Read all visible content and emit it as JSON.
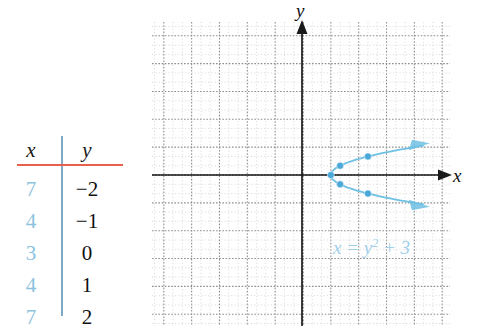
{
  "table": {
    "name": "xy-value-table",
    "headers": {
      "x": "x",
      "y": "y"
    },
    "rows": [
      {
        "x": "7",
        "y": "−2"
      },
      {
        "x": "4",
        "y": "−1"
      },
      {
        "x": "3",
        "y": "0"
      },
      {
        "x": "4",
        "y": "1"
      },
      {
        "x": "7",
        "y": "2"
      }
    ],
    "rule_color": "#e8604c",
    "divider_color": "#7fa8c6",
    "x_value_color": "#8cc3e0",
    "y_value_color": "#111111"
  },
  "graph": {
    "x_axis_label": "x",
    "y_axis_label": "y",
    "equation_lhs": "x = y",
    "equation_exp": "2",
    "equation_rhs": "+ 3",
    "curve_color": "#6ec1e4",
    "point_color": "#4aa8d8",
    "axis_color": "#1a1a1a",
    "grid_minor_color": "#d6d6d6",
    "grid_major_color": "#8f8f8f"
  },
  "chart_data": {
    "type": "line",
    "title": "",
    "xlabel": "x",
    "ylabel": "y",
    "annotations": [
      "x = y² + 3"
    ],
    "grid": true,
    "legend": "none",
    "xlim": [
      -16,
      19
    ],
    "ylim": [
      -16,
      16
    ],
    "relation": "x = y^2 + 3",
    "points": [
      {
        "x": 7,
        "y": -2
      },
      {
        "x": 4,
        "y": -1
      },
      {
        "x": 3,
        "y": 0
      },
      {
        "x": 4,
        "y": 1
      },
      {
        "x": 7,
        "y": 2
      }
    ],
    "x": [
      7,
      4,
      3,
      4,
      7
    ],
    "y": [
      -2,
      -1,
      0,
      1,
      2
    ],
    "series": [
      {
        "name": "x = y^2 + 3",
        "x": [
          7,
          4,
          3,
          4,
          7
        ],
        "y": [
          -2,
          -1,
          0,
          1,
          2
        ]
      }
    ]
  }
}
